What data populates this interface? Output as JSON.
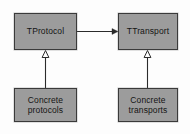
{
  "diagram": {
    "kind": "uml-class-diagram",
    "background_color": "#fdfdfd",
    "node_fill_color": "#9c9c9c",
    "node_border_color": "#3a3a3a",
    "line_color": "#2b2b2b",
    "text_color": "#141414",
    "nodes": [
      {
        "id": "tprotocol",
        "label": "TProtocol",
        "role": "interface",
        "x": 14,
        "y": 13,
        "w": 63,
        "h": 37
      },
      {
        "id": "ttransport",
        "label": "TTransport",
        "role": "interface",
        "x": 118,
        "y": 13,
        "w": 60,
        "h": 37
      },
      {
        "id": "concrete-protocols",
        "label": "Concrete\nprotocols",
        "role": "implementation",
        "x": 14,
        "y": 88,
        "w": 63,
        "h": 34
      },
      {
        "id": "concrete-transports",
        "label": "Concrete\ntransports",
        "role": "implementation",
        "x": 118,
        "y": 88,
        "w": 60,
        "h": 34
      }
    ],
    "edges": [
      {
        "id": "edge-protocol-uses-transport",
        "from": "tprotocol",
        "to": "ttransport",
        "type": "association",
        "arrowhead": "solid-filled",
        "direction": "right",
        "label": ""
      },
      {
        "id": "edge-concrete-protocols-inherits",
        "from": "concrete-protocols",
        "to": "tprotocol",
        "type": "generalization",
        "arrowhead": "hollow-triangle",
        "direction": "up",
        "label": ""
      },
      {
        "id": "edge-concrete-transports-inherits",
        "from": "concrete-transports",
        "to": "ttransport",
        "type": "generalization",
        "arrowhead": "hollow-triangle",
        "direction": "up",
        "label": ""
      }
    ]
  }
}
